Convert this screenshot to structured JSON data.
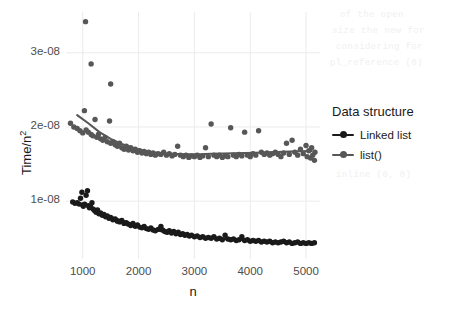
{
  "chart_data": {
    "type": "scatter",
    "title": "",
    "xlabel": "n",
    "ylabel": "Time/n2",
    "ylabel_display": "Time/n",
    "ylabel_exponent": "2",
    "xlim": [
      700,
      5250
    ],
    "ylim": [
      2.2e-09,
      3.55e-08
    ],
    "xticks": [
      1000,
      2000,
      3000,
      4000,
      5000
    ],
    "xticklabels": [
      "1000",
      "2000",
      "3000",
      "4000",
      "5000"
    ],
    "yticks": [
      1e-08,
      2e-08,
      3e-08
    ],
    "yticklabels": [
      "1e-08",
      "2e-08",
      "3e-08"
    ],
    "grid": true,
    "grid_color": "#ebebeb",
    "panel_background": "#ffffff",
    "legend": {
      "title": "Data structure",
      "position": "right",
      "entries": [
        {
          "name": "Linked list",
          "color": "#1a1a1a"
        },
        {
          "name": "list()",
          "color": "#575757"
        }
      ]
    },
    "series": [
      {
        "name": "Linked list",
        "color": "#1a1a1a",
        "marker": "circle",
        "has_trend_line": true,
        "points": [
          [
            820,
            9.9e-09
          ],
          [
            860,
            9.7e-09
          ],
          [
            900,
            9.8e-09
          ],
          [
            935,
            9.6e-09
          ],
          [
            960,
            1.04e-08
          ],
          [
            985,
            1.12e-08
          ],
          [
            1000,
            9.5e-09
          ],
          [
            1010,
            9.3e-09
          ],
          [
            1035,
            9.6e-09
          ],
          [
            1060,
            1.08e-08
          ],
          [
            1085,
            1.14e-08
          ],
          [
            1100,
            9.4e-09
          ],
          [
            1120,
            9.1e-09
          ],
          [
            1140,
            9.3e-09
          ],
          [
            1165,
            9.8e-09
          ],
          [
            1190,
            8.9e-09
          ],
          [
            1215,
            8.7e-09
          ],
          [
            1240,
            8.5e-09
          ],
          [
            1265,
            8.8e-09
          ],
          [
            1290,
            8.3e-09
          ],
          [
            1320,
            8.4e-09
          ],
          [
            1350,
            8.1e-09
          ],
          [
            1380,
            8.2e-09
          ],
          [
            1410,
            7.9e-09
          ],
          [
            1440,
            8e-09
          ],
          [
            1470,
            7.7e-09
          ],
          [
            1500,
            7.8e-09
          ],
          [
            1540,
            7.5e-09
          ],
          [
            1580,
            7.6e-09
          ],
          [
            1620,
            7.3e-09
          ],
          [
            1660,
            7.2e-09
          ],
          [
            1700,
            7.4e-09
          ],
          [
            1740,
            7e-09
          ],
          [
            1780,
            7.1e-09
          ],
          [
            1820,
            6.9e-09
          ],
          [
            1860,
            6.7e-09
          ],
          [
            1900,
            7e-09
          ],
          [
            1940,
            6.6e-09
          ],
          [
            1980,
            6.8e-09
          ],
          [
            2020,
            6.5e-09
          ],
          [
            2060,
            6.4e-09
          ],
          [
            2100,
            6.6e-09
          ],
          [
            2140,
            6.3e-09
          ],
          [
            2180,
            6.2e-09
          ],
          [
            2220,
            6.4e-09
          ],
          [
            2260,
            6.1e-09
          ],
          [
            2300,
            6e-09
          ],
          [
            2350,
            6.2e-09
          ],
          [
            2400,
            6.6e-09
          ],
          [
            2430,
            6.1e-09
          ],
          [
            2470,
            5.9e-09
          ],
          [
            2510,
            5.8e-09
          ],
          [
            2550,
            6e-09
          ],
          [
            2590,
            5.7e-09
          ],
          [
            2630,
            5.9e-09
          ],
          [
            2670,
            5.6e-09
          ],
          [
            2710,
            5.8e-09
          ],
          [
            2750,
            5.5e-09
          ],
          [
            2790,
            5.6e-09
          ],
          [
            2830,
            5.4e-09
          ],
          [
            2870,
            5.5e-09
          ],
          [
            2910,
            5.3e-09
          ],
          [
            2950,
            5.4e-09
          ],
          [
            3000,
            5.2e-09
          ],
          [
            3050,
            5.3e-09
          ],
          [
            3100,
            5.1e-09
          ],
          [
            3150,
            5.2e-09
          ],
          [
            3200,
            5e-09
          ],
          [
            3250,
            5.1e-09
          ],
          [
            3300,
            5e-09
          ],
          [
            3350,
            5.2e-09
          ],
          [
            3400,
            4.9e-09
          ],
          [
            3450,
            5e-09
          ],
          [
            3500,
            4.8e-09
          ],
          [
            3550,
            5.4e-09
          ],
          [
            3600,
            4.9e-09
          ],
          [
            3650,
            4.8e-09
          ],
          [
            3700,
            4.9e-09
          ],
          [
            3750,
            4.7e-09
          ],
          [
            3800,
            4.8e-09
          ],
          [
            3850,
            5.2e-09
          ],
          [
            3900,
            4.7e-09
          ],
          [
            3950,
            4.8e-09
          ],
          [
            4000,
            4.6e-09
          ],
          [
            4050,
            4.7e-09
          ],
          [
            4100,
            4.6e-09
          ],
          [
            4150,
            4.7e-09
          ],
          [
            4200,
            4.5e-09
          ],
          [
            4250,
            4.6e-09
          ],
          [
            4300,
            4.5e-09
          ],
          [
            4350,
            4.6e-09
          ],
          [
            4400,
            4.4e-09
          ],
          [
            4450,
            4.5e-09
          ],
          [
            4500,
            4.4e-09
          ],
          [
            4550,
            4.5e-09
          ],
          [
            4600,
            4.6e-09
          ],
          [
            4650,
            4.4e-09
          ],
          [
            4700,
            4.5e-09
          ],
          [
            4750,
            4.3e-09
          ],
          [
            4800,
            4.4e-09
          ],
          [
            4850,
            4.5e-09
          ],
          [
            4900,
            4.3e-09
          ],
          [
            4950,
            4.4e-09
          ],
          [
            5000,
            4.3e-09
          ],
          [
            5050,
            4.4e-09
          ],
          [
            5100,
            4.3e-09
          ],
          [
            5150,
            4.4e-09
          ]
        ],
        "trend": [
          [
            900,
            9.8e-09
          ],
          [
            1100,
            9.2e-09
          ],
          [
            1300,
            8.5e-09
          ],
          [
            1500,
            7.9e-09
          ],
          [
            1700,
            7.4e-09
          ],
          [
            1900,
            6.9e-09
          ],
          [
            2100,
            6.5e-09
          ],
          [
            2300,
            6.1e-09
          ],
          [
            2500,
            5.8e-09
          ],
          [
            2700,
            5.6e-09
          ],
          [
            2900,
            5.4e-09
          ],
          [
            3100,
            5.2e-09
          ],
          [
            3300,
            5.05e-09
          ],
          [
            3500,
            4.95e-09
          ],
          [
            3700,
            4.85e-09
          ],
          [
            3900,
            4.75e-09
          ],
          [
            4100,
            4.65e-09
          ],
          [
            4300,
            4.58e-09
          ],
          [
            4500,
            4.5e-09
          ],
          [
            4700,
            4.45e-09
          ],
          [
            4900,
            4.4e-09
          ],
          [
            5100,
            4.38e-09
          ]
        ]
      },
      {
        "name": "list()",
        "color": "#575757",
        "marker": "circle",
        "has_trend_line": true,
        "points": [
          [
            1050,
            3.42e-08
          ],
          [
            1150,
            2.85e-08
          ],
          [
            1500,
            2.58e-08
          ],
          [
            780,
            2.05e-08
          ],
          [
            840,
            2e-08
          ],
          [
            900,
            1.98e-08
          ],
          [
            950,
            1.95e-08
          ],
          [
            1000,
            1.92e-08
          ],
          [
            1030,
            2.22e-08
          ],
          [
            1060,
            1.96e-08
          ],
          [
            1100,
            1.93e-08
          ],
          [
            1150,
            1.9e-08
          ],
          [
            1180,
            1.88e-08
          ],
          [
            1220,
            2.1e-08
          ],
          [
            1250,
            1.86e-08
          ],
          [
            1280,
            1.9e-08
          ],
          [
            1320,
            1.84e-08
          ],
          [
            1360,
            1.82e-08
          ],
          [
            1400,
            1.86e-08
          ],
          [
            1440,
            1.8e-08
          ],
          [
            1480,
            2.08e-08
          ],
          [
            1500,
            1.78e-08
          ],
          [
            1540,
            1.8e-08
          ],
          [
            1580,
            1.76e-08
          ],
          [
            1620,
            1.74e-08
          ],
          [
            1660,
            1.78e-08
          ],
          [
            1700,
            1.72e-08
          ],
          [
            1740,
            1.7e-08
          ],
          [
            1780,
            1.74e-08
          ],
          [
            1820,
            1.69e-08
          ],
          [
            1860,
            1.72e-08
          ],
          [
            1900,
            1.68e-08
          ],
          [
            1940,
            1.7e-08
          ],
          [
            1980,
            1.66e-08
          ],
          [
            2020,
            1.68e-08
          ],
          [
            2060,
            1.65e-08
          ],
          [
            2100,
            1.67e-08
          ],
          [
            2140,
            1.64e-08
          ],
          [
            2180,
            1.66e-08
          ],
          [
            2220,
            1.63e-08
          ],
          [
            2260,
            1.65e-08
          ],
          [
            2300,
            1.62e-08
          ],
          [
            2350,
            1.64e-08
          ],
          [
            2400,
            1.63e-08
          ],
          [
            2450,
            1.66e-08
          ],
          [
            2500,
            1.62e-08
          ],
          [
            2550,
            1.64e-08
          ],
          [
            2600,
            1.61e-08
          ],
          [
            2650,
            1.63e-08
          ],
          [
            2700,
            1.74e-08
          ],
          [
            2750,
            1.62e-08
          ],
          [
            2800,
            1.6e-08
          ],
          [
            2850,
            1.62e-08
          ],
          [
            2900,
            1.59e-08
          ],
          [
            2950,
            1.61e-08
          ],
          [
            3000,
            1.6e-08
          ],
          [
            3050,
            1.62e-08
          ],
          [
            3100,
            1.59e-08
          ],
          [
            3150,
            1.61e-08
          ],
          [
            3200,
            1.72e-08
          ],
          [
            3250,
            1.6e-08
          ],
          [
            3300,
            2.04e-08
          ],
          [
            3350,
            1.62e-08
          ],
          [
            3400,
            1.6e-08
          ],
          [
            3450,
            1.62e-08
          ],
          [
            3500,
            1.59e-08
          ],
          [
            3550,
            1.61e-08
          ],
          [
            3600,
            1.6e-08
          ],
          [
            3650,
            1.99e-08
          ],
          [
            3700,
            1.62e-08
          ],
          [
            3750,
            1.6e-08
          ],
          [
            3800,
            1.63e-08
          ],
          [
            3850,
            1.61e-08
          ],
          [
            3900,
            1.93e-08
          ],
          [
            3950,
            1.62e-08
          ],
          [
            4000,
            1.6e-08
          ],
          [
            4050,
            1.64e-08
          ],
          [
            4100,
            1.62e-08
          ],
          [
            4150,
            1.95e-08
          ],
          [
            4200,
            1.66e-08
          ],
          [
            4250,
            1.63e-08
          ],
          [
            4300,
            1.65e-08
          ],
          [
            4350,
            1.62e-08
          ],
          [
            4400,
            1.64e-08
          ],
          [
            4450,
            1.66e-08
          ],
          [
            4500,
            1.63e-08
          ],
          [
            4550,
            1.6e-08
          ],
          [
            4600,
            1.65e-08
          ],
          [
            4650,
            1.78e-08
          ],
          [
            4700,
            1.63e-08
          ],
          [
            4750,
            1.82e-08
          ],
          [
            4800,
            1.66e-08
          ],
          [
            4850,
            1.62e-08
          ],
          [
            4900,
            1.7e-08
          ],
          [
            4950,
            1.64e-08
          ],
          [
            5000,
            1.75e-08
          ],
          [
            5020,
            1.6e-08
          ],
          [
            5050,
            1.68e-08
          ],
          [
            5080,
            1.58e-08
          ],
          [
            5100,
            1.72e-08
          ],
          [
            5120,
            1.62e-08
          ],
          [
            5150,
            1.55e-08
          ],
          [
            5160,
            1.66e-08
          ]
        ],
        "trend": [
          [
            900,
            2.16e-08
          ],
          [
            1100,
            2.05e-08
          ],
          [
            1300,
            1.93e-08
          ],
          [
            1500,
            1.84e-08
          ],
          [
            1700,
            1.77e-08
          ],
          [
            1900,
            1.72e-08
          ],
          [
            2100,
            1.68e-08
          ],
          [
            2300,
            1.655e-08
          ],
          [
            2500,
            1.64e-08
          ],
          [
            2700,
            1.635e-08
          ],
          [
            2900,
            1.63e-08
          ],
          [
            3100,
            1.632e-08
          ],
          [
            3300,
            1.638e-08
          ],
          [
            3500,
            1.642e-08
          ],
          [
            3700,
            1.645e-08
          ],
          [
            3900,
            1.648e-08
          ],
          [
            4100,
            1.652e-08
          ],
          [
            4300,
            1.658e-08
          ],
          [
            4500,
            1.662e-08
          ],
          [
            4700,
            1.668e-08
          ],
          [
            4900,
            1.672e-08
          ],
          [
            5100,
            1.676e-08
          ]
        ]
      }
    ]
  },
  "background_ghost_text": [
    "of the open",
    "size the new for",
    "considering for",
    "selecting free list(), 0.0",
    "pl_reference (0)",
    "index_structure list the",
    "inline (0, 0)",
    "only use a row time"
  ]
}
